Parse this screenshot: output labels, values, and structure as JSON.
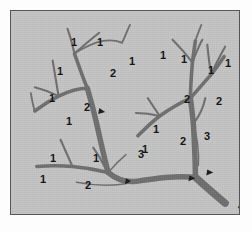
{
  "figure": {
    "type": "stream-order-diagram",
    "background_color": "#c3c3c3",
    "frame_color": "#55555a",
    "stream_color": "#6e6e6e",
    "label_color": "#161616",
    "marker_color": "#1a1a1a"
  },
  "chart_data": {
    "type": "diagram",
    "orders": [
      1,
      2,
      3,
      4
    ],
    "order_counts": {
      "1": 16,
      "2": 7,
      "3": 3,
      "4": 1
    },
    "legend": [],
    "xlabel": "",
    "ylabel": ""
  },
  "labels": [
    {
      "text": "1",
      "x": 60,
      "y": 26
    },
    {
      "text": "1",
      "x": 86,
      "y": 26
    },
    {
      "text": "1",
      "x": 118,
      "y": 45
    },
    {
      "text": "2",
      "x": 99,
      "y": 57
    },
    {
      "text": "1",
      "x": 46,
      "y": 55
    },
    {
      "text": "1",
      "x": 38,
      "y": 82
    },
    {
      "text": "2",
      "x": 73,
      "y": 91
    },
    {
      "text": "1",
      "x": 55,
      "y": 105
    },
    {
      "text": "3",
      "x": 127,
      "y": 138
    },
    {
      "text": "1",
      "x": 39,
      "y": 142
    },
    {
      "text": "1",
      "x": 82,
      "y": 142
    },
    {
      "text": "1",
      "x": 29,
      "y": 163
    },
    {
      "text": "2",
      "x": 74,
      "y": 169
    },
    {
      "text": "1",
      "x": 149,
      "y": 39
    },
    {
      "text": "1",
      "x": 170,
      "y": 43
    },
    {
      "text": "2",
      "x": 173,
      "y": 83
    },
    {
      "text": "1",
      "x": 197,
      "y": 54
    },
    {
      "text": "1",
      "x": 214,
      "y": 47
    },
    {
      "text": "2",
      "x": 205,
      "y": 85
    },
    {
      "text": "3",
      "x": 193,
      "y": 120
    },
    {
      "text": "1",
      "x": 142,
      "y": 113
    },
    {
      "text": "1",
      "x": 131,
      "y": 133
    },
    {
      "text": "2",
      "x": 169,
      "y": 125
    },
    {
      "text": "4",
      "x": 227,
      "y": 190
    }
  ],
  "markers": [
    {
      "x": 99,
      "y": 110
    },
    {
      "x": 128,
      "y": 181
    },
    {
      "x": 192,
      "y": 178
    },
    {
      "x": 210,
      "y": 172
    }
  ]
}
